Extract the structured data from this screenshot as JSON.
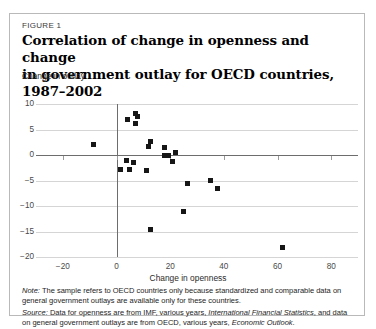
{
  "figure": {
    "label": "FIGURE 1",
    "title_line1": "Correlation of change in openness and change",
    "title_line2": "in government outlay for OECD countries, 1987–2002",
    "y_axis_title": "Change in outlay",
    "x_axis_title": "Change in openness"
  },
  "notes": {
    "note_prefix": "Note:",
    "note_text": " The sample refers to OECD countries only because standardized and comparable data on general government outlays are available only for these countries.",
    "source_prefix": "Source:",
    "source_text_a": " Data for openness are from IMF, various years, ",
    "source_italic_a": "International Financial Statistics",
    "source_text_b": ", and data on general government outlays are from OECD, various years, ",
    "source_italic_b": "Economic Outlook",
    "source_text_c": "."
  },
  "colors": {
    "marker": "#161616",
    "gridline": "#d5d5d5",
    "axisline": "#6d6d6d",
    "border": "#b9b9b9"
  },
  "chart_data": {
    "type": "scatter",
    "title": "Correlation of change in openness and change in government outlay for OECD countries, 1987–2002",
    "xlabel": "Change in openness",
    "ylabel": "Change in outlay",
    "xlim": [
      -30,
      90
    ],
    "ylim": [
      -20,
      10
    ],
    "xticks": [
      -20,
      0,
      20,
      40,
      60,
      80
    ],
    "yticks": [
      10,
      5,
      0,
      -5,
      -10,
      -15,
      -20
    ],
    "grid": true,
    "legend": null,
    "series": [
      {
        "name": "OECD countries",
        "points": [
          [
            -8.5,
            2.0
          ],
          [
            4.0,
            7.0
          ],
          [
            7.2,
            8.2
          ],
          [
            7.8,
            7.6
          ],
          [
            7.0,
            6.2
          ],
          [
            12.8,
            2.7
          ],
          [
            12.0,
            1.7
          ],
          [
            17.8,
            1.4
          ],
          [
            22.0,
            0.5
          ],
          [
            18.0,
            0.0
          ],
          [
            19.5,
            -0.1
          ],
          [
            20.8,
            -1.3
          ],
          [
            3.8,
            -1.1
          ],
          [
            6.5,
            -1.5
          ],
          [
            1.5,
            -2.9
          ],
          [
            5.0,
            -2.9
          ],
          [
            11.0,
            -3.0
          ],
          [
            26.5,
            -5.6
          ],
          [
            35.0,
            -5.0
          ],
          [
            37.8,
            -6.6
          ],
          [
            25.0,
            -11.0
          ],
          [
            12.8,
            -14.6
          ],
          [
            62.0,
            -18.2
          ]
        ]
      }
    ]
  }
}
